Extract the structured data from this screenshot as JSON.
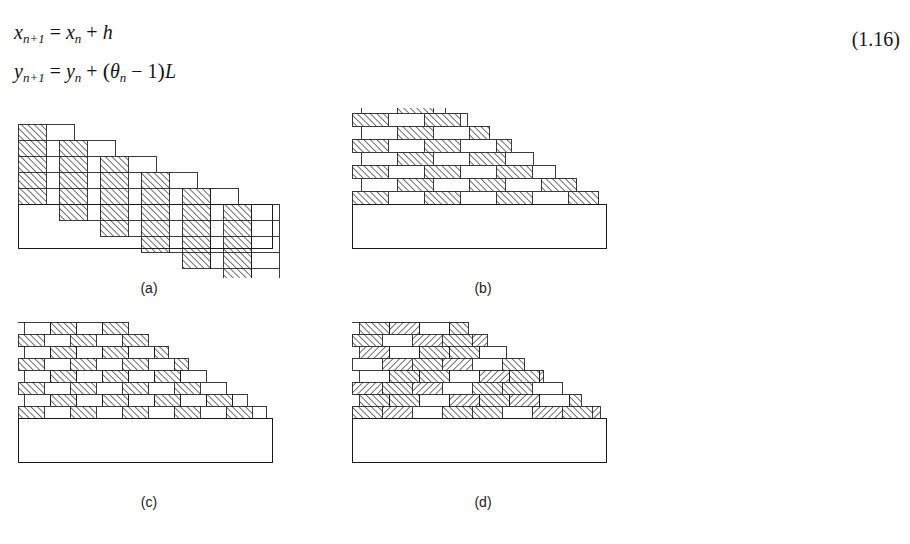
{
  "equation": {
    "line1": {
      "lhs_var": "x",
      "lhs_sub": "n+1",
      "relation": "=",
      "rhs_var": "x",
      "rhs_sub": "n",
      "operator": "+",
      "term": "h",
      "plain": "x_{n+1} = x_n + h"
    },
    "line2": {
      "lhs_var": "y",
      "lhs_sub": "n+1",
      "relation": "=",
      "rhs_var": "y",
      "rhs_sub": "n",
      "operator": "+",
      "open_paren": "(",
      "theta": "θ",
      "theta_sub": "n",
      "minus": "−",
      "one": "1",
      "close_paren": ")",
      "length": "L",
      "plain": "y_{n+1} = y_n + (θ_n − 1)L"
    },
    "number": "(1.16)"
  },
  "figures": [
    {
      "id": "a",
      "label": "(a)",
      "caption_text": "(a)",
      "pattern": "staircase-columns",
      "description": "Descending staircase of tall hatched and blank column pairs over an outer rectangle",
      "steps": 6,
      "rows_per_step": 5,
      "cell_width": 28,
      "cell_height": 16,
      "step_drop": 16,
      "hatch_angle_deg": 45,
      "hatch_direction": "forward",
      "outline_color": "#1a1a1a",
      "hatch_color": "#2b2b2b",
      "fill_color": "#ffffff",
      "base_rect": {
        "x": 14,
        "y": 96,
        "w": 254,
        "h": 44
      }
    },
    {
      "id": "b",
      "label": "(b)",
      "caption_text": "(b)",
      "pattern": "running-bond-bricks-wide",
      "description": "Running bond masonry of wide bricks, alternating hatched and blank, stepped down to the right",
      "rows": 9,
      "brick_width": 36,
      "brick_height": 13,
      "offset_per_row": 18,
      "hatch_angle_deg": 45,
      "hatch_direction": "forward",
      "outline_color": "#1a1a1a",
      "hatch_color": "#2b2b2b",
      "fill_color": "#ffffff",
      "base_rect": {
        "x": 14,
        "y": 96,
        "w": 254,
        "h": 44
      }
    },
    {
      "id": "c",
      "label": "(c)",
      "caption_text": "(c)",
      "pattern": "running-bond-bricks-dense",
      "description": "Denser running bond masonry of small bricks in checkerboard hatching, stepped down to the right",
      "rows": 11,
      "brick_width": 26,
      "brick_height": 12,
      "offset_per_row": 13,
      "hatch_angle_deg": 45,
      "hatch_direction": "forward",
      "outline_color": "#1a1a1a",
      "hatch_color": "#2b2b2b",
      "fill_color": "#ffffff",
      "base_rect": {
        "x": 14,
        "y": 96,
        "w": 254,
        "h": 44
      }
    },
    {
      "id": "d",
      "label": "(d)",
      "caption_text": "(d)",
      "pattern": "running-bond-bricks-variable-hatch",
      "description": "Running bond masonry where hatch direction varies across columns, producing arc-like bands",
      "rows": 11,
      "brick_width": 30,
      "brick_height": 12,
      "offset_per_row": 15,
      "hatch_angle_deg": 45,
      "hatch_direction": "mixed",
      "outline_color": "#1a1a1a",
      "hatch_color": "#2b2b2b",
      "fill_color": "#ffffff",
      "base_rect": {
        "x": 14,
        "y": 96,
        "w": 254,
        "h": 44
      }
    }
  ],
  "colors": {
    "page_background": "#ffffff",
    "ink": "#1a1a1a",
    "outline": "#1a1a1a",
    "hatch": "#2b2b2b"
  }
}
